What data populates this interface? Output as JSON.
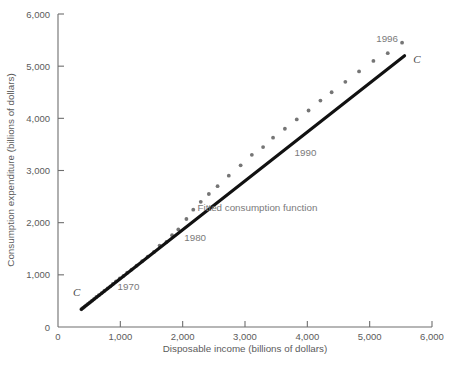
{
  "chart_data": {
    "type": "scatter",
    "title": "",
    "xlabel": "Disposable income (billions of dollars)",
    "ylabel": "Consumption expenditure (billions of dollars)",
    "xlim": [
      0,
      6000
    ],
    "ylim": [
      0,
      6000
    ],
    "xticks": [
      0,
      1000,
      2000,
      3000,
      4000,
      5000,
      6000
    ],
    "yticks": [
      0,
      1000,
      2000,
      3000,
      4000,
      5000,
      6000
    ],
    "xtick_labels": [
      "0",
      "1,000",
      "2,000",
      "3,000",
      "4,000",
      "5,000",
      "6,000"
    ],
    "ytick_labels": [
      "0",
      "1,000",
      "2,000",
      "3,000",
      "4,000",
      "5,000",
      "6,000"
    ],
    "grid": false,
    "legend": false,
    "point_color": "#757575",
    "line_color": "#111111",
    "series": [
      {
        "name": "Consumption vs disposable income",
        "x": [
          375,
          400,
          425,
          450,
          480,
          510,
          545,
          580,
          615,
          655,
          700,
          745,
          795,
          840,
          880,
          930,
          990,
          1050,
          1110,
          1180,
          1260,
          1350,
          1440,
          1540,
          1630,
          1740,
          1830,
          1930,
          2060,
          2170,
          2290,
          2420,
          2560,
          2740,
          2930,
          3110,
          3290,
          3450,
          3640,
          3830,
          4020,
          4210,
          4390,
          4610,
          4830,
          5060,
          5290,
          5520
        ],
        "y": [
          340,
          365,
          390,
          415,
          445,
          470,
          505,
          540,
          575,
          610,
          650,
          695,
          740,
          780,
          825,
          875,
          930,
          980,
          1040,
          1100,
          1175,
          1260,
          1350,
          1440,
          1560,
          1630,
          1760,
          1870,
          2070,
          2250,
          2400,
          2550,
          2700,
          2900,
          3100,
          3300,
          3450,
          3630,
          3800,
          3980,
          4150,
          4340,
          4500,
          4700,
          4900,
          5100,
          5250,
          5450
        ]
      }
    ],
    "fit_line": {
      "name": "Fitted consumption function",
      "x_start": 375,
      "y_start": 340,
      "x_end": 5560,
      "y_end": 5200
    },
    "annotations": [
      {
        "text": "1970",
        "x_data": 1130,
        "y_data": 700,
        "name": "year-label-1970"
      },
      {
        "text": "1980",
        "x_data": 2200,
        "y_data": 1640,
        "name": "year-label-1980"
      },
      {
        "text": "1990",
        "x_data": 3970,
        "y_data": 3280,
        "name": "year-label-1990"
      },
      {
        "text": "1996",
        "x_data": 5280,
        "y_data": 5470,
        "name": "year-label-1996"
      },
      {
        "text": "Fitted consumption function",
        "x_data": 3200,
        "y_data": 2230,
        "name": "fitted-function-label"
      }
    ],
    "curve_labels": [
      {
        "text": "C",
        "x_data": 300,
        "y_data": 590,
        "name": "curve-label-c-lower"
      },
      {
        "text": "C",
        "x_data": 5760,
        "y_data": 5070,
        "name": "curve-label-c-upper"
      }
    ]
  }
}
